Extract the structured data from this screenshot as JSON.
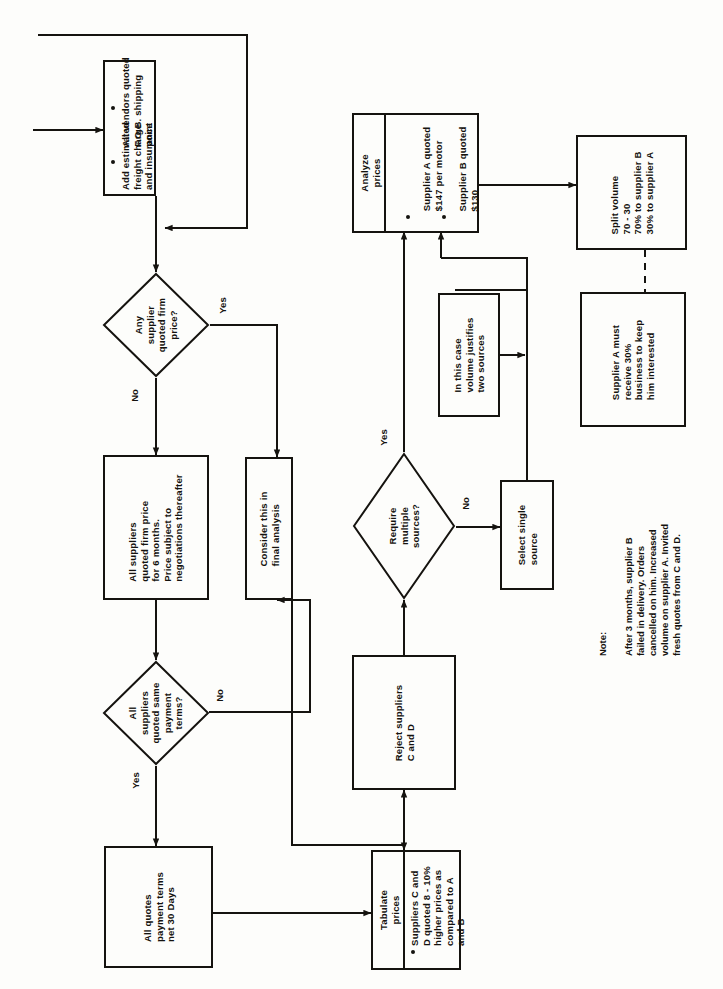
{
  "meta": {
    "orientation": "rotated-90-ccw",
    "ink_color": "#15130f",
    "paper_color": "#fdfdfb"
  },
  "nodes": {
    "vendors_quoted": {
      "kind": "process-bulleted",
      "bullets": [
        "All vendors quoted\nF.O.B. shipping\npoint",
        "Add estimated\nfreight charge\nand insurance"
      ]
    },
    "any_firm_price": {
      "kind": "decision",
      "text": "Any\nsupplier\nquoted firm\nprice?",
      "yes_label": "Yes",
      "no_label": "No"
    },
    "firm_price_6_months": {
      "kind": "process",
      "text": "All suppliers\nquoted firm price\nfor 6 months.\nPrice subject to\nnegotiations thereafter"
    },
    "consider_final": {
      "kind": "process",
      "text": "Consider this in\nfinal analysis"
    },
    "same_payment_terms": {
      "kind": "decision",
      "text": "All\nsuppliers\nquoted same\npayment\nterms?",
      "yes_label": "Yes",
      "no_label": "No"
    },
    "net_30_days": {
      "kind": "process",
      "text": "All quotes\npayment terms\nnet 30 Days"
    },
    "tabulate_prices": {
      "kind": "process-bulleted",
      "header": "Tabulate\nprices",
      "bullets": [
        "Suppliers C and\nD quoted 8 - 10%\nhigher prices as\ncompared to A\nand B"
      ]
    },
    "reject_c_d": {
      "kind": "process",
      "text": "Reject suppliers\nC and D"
    },
    "require_multiple": {
      "kind": "decision",
      "text": "Require\nmultiple\nsources?",
      "yes_label": "Yes",
      "no_label": "No"
    },
    "select_single": {
      "kind": "process",
      "text": "Select single\nsource"
    },
    "volume_justifies": {
      "kind": "process",
      "text": "In this case\nvolume justifies\ntwo sources"
    },
    "analyze_prices": {
      "kind": "process-bulleted",
      "header": "Analyze\nprices",
      "bullets": [
        "Supplier A quoted\n$147 per motor",
        "Supplier B quoted\n$130"
      ]
    },
    "split_volume": {
      "kind": "process",
      "text": "Split volume\n70 - 30\n70% to supplier B\n30% to supplier A"
    },
    "supplier_a_30": {
      "kind": "process",
      "text": "Supplier A must\nreceive 30%\nbusiness to keep\nhim interested"
    }
  },
  "note": {
    "label": "Note:",
    "text": "After 3 months, supplier B\nfailed in delivery. Orders\ncancelled on him. Increased\nvolume on supplier A. Invited\nfresh quotes from C and D."
  }
}
